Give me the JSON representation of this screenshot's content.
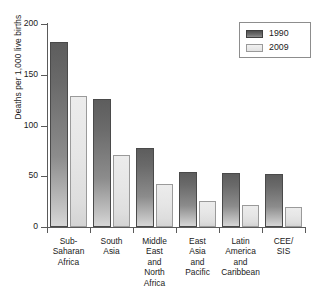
{
  "chart_data": {
    "type": "bar",
    "title": "",
    "xlabel": "",
    "ylabel": "Deaths per 1,000 live births",
    "ylim": [
      0,
      200
    ],
    "yticks": [
      0,
      50,
      100,
      150,
      200
    ],
    "ytick_labels": [
      "0",
      "50",
      "100",
      "150",
      "200"
    ],
    "grid": false,
    "legend_position": "top-right",
    "categories": [
      "Sub-\nSaharan\nAfrica",
      "South\nAsia",
      "Middle\nEast\nand\nNorth\nAfrica",
      "East\nAsia\nand\nPacific",
      "Latin\nAmerica\nand\nCaribbean",
      "CEE/\nSIS"
    ],
    "category_labels_flat": [
      "Sub-Saharan Africa",
      "South Asia",
      "Middle East and North Africa",
      "East Asia and Pacific",
      "Latin America and Caribbean",
      "CEE/SIS"
    ],
    "series": [
      {
        "name": "1990",
        "color": "#6a6a6a",
        "values": [
          182,
          126,
          78,
          54,
          53,
          52
        ]
      },
      {
        "name": "2009",
        "color": "#e6e6e6",
        "values": [
          129,
          71,
          42,
          26,
          22,
          20
        ]
      }
    ]
  },
  "legend": {
    "entries": [
      {
        "label": "1990",
        "swatch": "dark-gradient-swatch"
      },
      {
        "label": "2009",
        "swatch": "light-gradient-swatch"
      }
    ]
  },
  "axis": {
    "y_title": "Deaths per 1,000 live births",
    "y_tick_labels": [
      "200",
      "150",
      "100",
      "50",
      "0"
    ]
  }
}
